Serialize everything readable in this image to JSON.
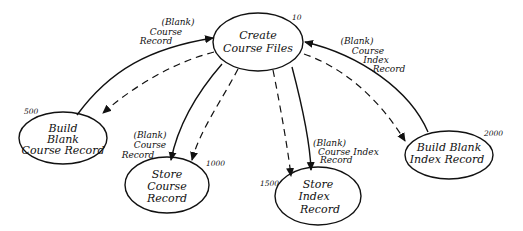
{
  "diagram": {
    "type": "structure-chart / data flow diagram",
    "nodes": [
      {
        "id": "create",
        "number": "10",
        "lines": [
          "Create",
          "Course Files"
        ]
      },
      {
        "id": "build_course",
        "number": "500",
        "lines": [
          "Build",
          "Blank",
          "Course Record"
        ]
      },
      {
        "id": "store_course",
        "number": "1000",
        "lines": [
          "Store",
          "Course",
          "Record"
        ]
      },
      {
        "id": "store_index",
        "number": "1500",
        "lines": [
          "Store",
          "Index",
          "Record"
        ]
      },
      {
        "id": "build_index",
        "number": "2000",
        "lines": [
          "Build Blank",
          "Index Record"
        ]
      }
    ],
    "flow_labels": {
      "to_create_from_build_course": [
        "(Blank)",
        "Course",
        "Record"
      ],
      "to_create_from_build_index": [
        "(Blank)",
        "Course",
        "Index",
        "Record"
      ],
      "to_store_course": [
        "(Blank)",
        "Course",
        "Record"
      ],
      "to_store_index": [
        "(Blank)",
        "Course Index",
        "Record"
      ]
    },
    "edges": [
      {
        "from": "build_course",
        "to": "create",
        "style": "solid",
        "label": "(Blank) Course Record"
      },
      {
        "from": "create",
        "to": "build_course",
        "style": "dashed"
      },
      {
        "from": "create",
        "to": "store_course",
        "style": "solid",
        "label": "(Blank) Course Record"
      },
      {
        "from": "create",
        "to": "store_course",
        "style": "dashed"
      },
      {
        "from": "create",
        "to": "store_index",
        "style": "dashed"
      },
      {
        "from": "create",
        "to": "store_index",
        "style": "solid",
        "label": "(Blank) Course Index Record"
      },
      {
        "from": "build_index",
        "to": "create",
        "style": "solid",
        "label": "(Blank) Course Index Record"
      },
      {
        "from": "create",
        "to": "build_index",
        "style": "dashed"
      }
    ],
    "colors": {
      "ink": "#111111",
      "background": "#ffffff"
    }
  }
}
